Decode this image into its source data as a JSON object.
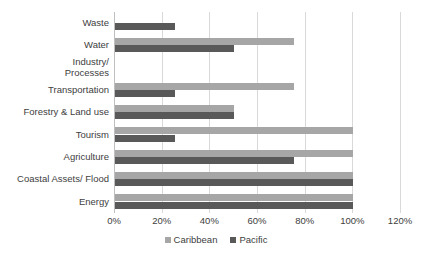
{
  "chart_data": {
    "type": "bar",
    "orientation": "horizontal",
    "title": "",
    "subtitle": "",
    "xlabel": "",
    "ylabel": "",
    "xlim": [
      0,
      120
    ],
    "xticks": [
      0,
      20,
      40,
      60,
      80,
      100,
      120
    ],
    "xtick_labels": [
      "0%",
      "20%",
      "40%",
      "60%",
      "80%",
      "100%",
      "120%"
    ],
    "grid": "vertical",
    "legend_position": "bottom-center",
    "categories": [
      "Waste",
      "Water",
      "Industry/ Processes",
      "Transportation",
      "Forestry & Land use",
      "Tourism",
      "Agriculture",
      "Coastal Assets/ Flood",
      "Energy"
    ],
    "category_lines": [
      [
        "Waste"
      ],
      [
        "Water"
      ],
      [
        "Industry/",
        "Processes"
      ],
      [
        "Transportation"
      ],
      [
        "Forestry & Land use"
      ],
      [
        "Tourism"
      ],
      [
        "Agriculture"
      ],
      [
        "Coastal Assets/ Flood"
      ],
      [
        "Energy"
      ]
    ],
    "series": [
      {
        "name": "Caribbean",
        "color": "#a6a6a6",
        "values": [
          0,
          75,
          0,
          75,
          50,
          100,
          100,
          100,
          100
        ]
      },
      {
        "name": "Pacific",
        "color": "#595959",
        "values": [
          25,
          50,
          0,
          25,
          50,
          25,
          75,
          100,
          100
        ]
      }
    ]
  },
  "legend": {
    "items": [
      {
        "label": "Caribbean",
        "color": "#a6a6a6"
      },
      {
        "label": "Pacific",
        "color": "#595959"
      }
    ]
  },
  "colors": {
    "caribbean": "#a6a6a6",
    "pacific": "#595959",
    "gridline": "#d9d9d9",
    "axis": "#bfbfbf",
    "text": "#404040",
    "background": "#ffffff"
  }
}
